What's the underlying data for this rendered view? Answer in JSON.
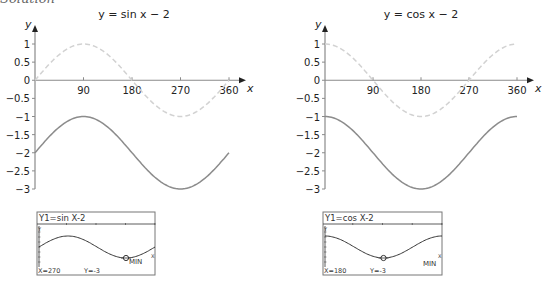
{
  "heading": "Solution",
  "chart_data": [
    {
      "type": "line",
      "title": "y = sin x − 2",
      "xlabel": "x",
      "ylabel": "y",
      "x_ticks": [
        90,
        180,
        270,
        360
      ],
      "y_ticks": [
        1,
        0.5,
        0,
        -0.5,
        -1,
        -1.5,
        -2,
        -2.5,
        -3
      ],
      "y_tick_labels": [
        "1",
        "0.5",
        "0",
        "−0.5",
        "−1",
        "−1.5",
        "−2",
        "−2.5",
        "−3"
      ],
      "xlim": [
        0,
        360
      ],
      "ylim": [
        -3,
        1
      ],
      "grid": false,
      "series": [
        {
          "name": "y = sin x",
          "style": "dashed",
          "color": "#d2d2d2",
          "x": [
            0,
            45,
            90,
            135,
            180,
            225,
            270,
            315,
            360
          ],
          "values": [
            0,
            0.71,
            1,
            0.71,
            0,
            -0.71,
            -1,
            -0.71,
            0
          ]
        },
        {
          "name": "y = sin x − 2",
          "style": "solid",
          "color": "#8c8c8c",
          "x": [
            0,
            45,
            90,
            135,
            180,
            225,
            270,
            315,
            360
          ],
          "values": [
            -2,
            -1.29,
            -1,
            -1.29,
            -2,
            -2.71,
            -3,
            -2.71,
            -2
          ]
        }
      ]
    },
    {
      "type": "line",
      "title": "y = cos x − 2",
      "xlabel": "x",
      "ylabel": "y",
      "x_ticks": [
        90,
        180,
        270,
        360
      ],
      "y_ticks": [
        1,
        0.5,
        0,
        -0.5,
        -1,
        -1.5,
        -2,
        -2.5,
        -3
      ],
      "y_tick_labels": [
        "1",
        "0.5",
        "0",
        "−0.5",
        "−1",
        "−1.5",
        "−2",
        "−2.5",
        "−3"
      ],
      "xlim": [
        0,
        360
      ],
      "ylim": [
        -3,
        1
      ],
      "grid": false,
      "series": [
        {
          "name": "y = cos x",
          "style": "dashed",
          "color": "#d2d2d2",
          "x": [
            0,
            45,
            90,
            135,
            180,
            225,
            270,
            315,
            360
          ],
          "values": [
            1,
            0.71,
            0,
            -0.71,
            -1,
            -0.71,
            0,
            0.71,
            1
          ]
        },
        {
          "name": "y = cos x − 2",
          "style": "solid",
          "color": "#8c8c8c",
          "x": [
            0,
            45,
            90,
            135,
            180,
            225,
            270,
            315,
            360
          ],
          "values": [
            -1,
            -1.29,
            -2,
            -2.71,
            -3,
            -2.71,
            -2,
            -1.29,
            -1
          ]
        }
      ]
    }
  ],
  "calculators": [
    {
      "equation": "Y1=sin X-2",
      "x_readout": "X=270",
      "y_readout": "Y=-3",
      "mode": "MIN",
      "fn": "sin"
    },
    {
      "equation": "Y1=cos X-2",
      "x_readout": "X=180",
      "y_readout": "Y=-3",
      "mode": "MIN",
      "fn": "cos"
    }
  ],
  "colors": {
    "axis": "#8a8a8a",
    "solid_curve": "#8c8c8c",
    "dashed_curve": "#d2d2d2",
    "text": "#222222",
    "calc_ink": "#333333"
  }
}
